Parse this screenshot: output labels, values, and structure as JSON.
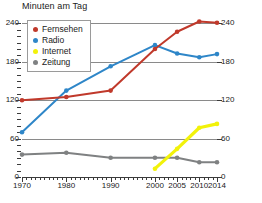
{
  "chart_title": "Minuten am Tag",
  "footnote": "",
  "colors": {
    "fernsehen": "#c0392b",
    "radio": "#2e86c8",
    "internet": "#f2f20a",
    "zeitung": "#7f8182",
    "grid": "#8a8a8a",
    "axis": "#3b3b3b",
    "text": "#1a1a1a"
  },
  "legend": {
    "items": [
      {
        "label": "Fernsehen",
        "color": "#c0392b"
      },
      {
        "label": "Radio",
        "color": "#2e86c8"
      },
      {
        "label": "Internet",
        "color": "#f2f20a"
      },
      {
        "label": "Zeitung",
        "color": "#7f8182"
      }
    ]
  },
  "axes": {
    "y_ticks": [
      "0",
      "60",
      "120",
      "180",
      "240"
    ],
    "x_ticks": [
      "1970",
      "1980",
      "1990",
      "2000",
      "2005",
      "2010",
      "2014"
    ]
  },
  "chart_data": {
    "type": "line",
    "title": "Minuten am Tag",
    "xlabel": "",
    "ylabel": "Minuten am Tag",
    "xlim": [
      1970,
      2014
    ],
    "ylim": [
      0,
      250
    ],
    "grid": true,
    "legend_position": "top-left",
    "x": [
      1970,
      1980,
      1990,
      2000,
      2005,
      2010,
      2014
    ],
    "series": [
      {
        "name": "Fernsehen",
        "color": "#c0392b",
        "values": [
          120,
          125,
          135,
          200,
          227,
          243,
          241
        ]
      },
      {
        "name": "Radio",
        "color": "#2e86c8",
        "values": [
          70,
          135,
          173,
          206,
          193,
          187,
          192
        ]
      },
      {
        "name": "Internet",
        "color": "#f2f20a",
        "values": [
          null,
          null,
          null,
          13,
          44,
          77,
          83
        ]
      },
      {
        "name": "Zeitung",
        "color": "#7f8182",
        "values": [
          35,
          38,
          30,
          30,
          30,
          23,
          23
        ]
      }
    ]
  }
}
